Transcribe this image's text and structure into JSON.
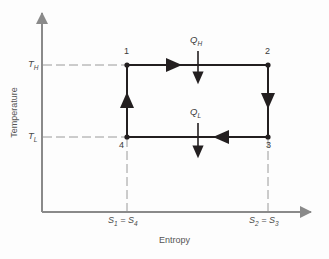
{
  "figure": {
    "kind": "carnot-cycle-temperature-entropy-diagram",
    "background_color": "#fdfdfd"
  },
  "axes": {
    "y": {
      "title": "Temperature",
      "axis_color": "#8a8a8a",
      "ticks": [
        {
          "id": "TH",
          "label_main": "T",
          "label_sub": "H",
          "y_px": 65
        },
        {
          "id": "TL",
          "label_main": "T",
          "label_sub": "L",
          "y_px": 137
        }
      ]
    },
    "x": {
      "title": "Entropy",
      "axis_color": "#8a8a8a",
      "ticks": [
        {
          "id": "S1S4",
          "parts": [
            "S",
            "1",
            " = ",
            "S",
            "4"
          ],
          "x_px": 127
        },
        {
          "id": "S2S3",
          "parts": [
            "S",
            "2",
            " = ",
            "S",
            "3"
          ],
          "x_px": 268
        }
      ]
    }
  },
  "cycle": {
    "line_color": "#231f20",
    "guide_color": "#9a9a9a",
    "states": [
      {
        "id": "1",
        "label": "1",
        "x_px": 127,
        "y_px": 65
      },
      {
        "id": "2",
        "label": "2",
        "x_px": 268,
        "y_px": 65
      },
      {
        "id": "3",
        "label": "3",
        "x_px": 268,
        "y_px": 137
      },
      {
        "id": "4",
        "label": "4",
        "x_px": 127,
        "y_px": 137
      }
    ],
    "processes": [
      {
        "from": "1",
        "to": "2",
        "direction": "right",
        "name": "isothermal-heat-addition"
      },
      {
        "from": "2",
        "to": "3",
        "direction": "down",
        "name": "isentropic-expansion"
      },
      {
        "from": "3",
        "to": "4",
        "direction": "left",
        "name": "isothermal-heat-rejection"
      },
      {
        "from": "4",
        "to": "1",
        "direction": "up",
        "name": "isentropic-compression"
      }
    ]
  },
  "heat_flows": [
    {
      "id": "QH",
      "label_main": "Q",
      "label_sub": "H",
      "x_px": 198,
      "label_y_px": 38,
      "arrow_from_y_px": 51,
      "arrow_to_y_px": 81,
      "name": "heat-added"
    },
    {
      "id": "QL",
      "label_main": "Q",
      "label_sub": "L",
      "x_px": 198,
      "label_y_px": 110,
      "arrow_from_y_px": 123,
      "arrow_to_y_px": 155,
      "name": "heat-rejected"
    }
  ]
}
